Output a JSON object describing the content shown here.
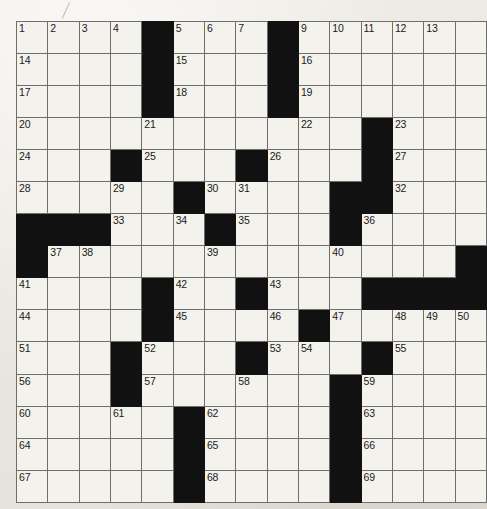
{
  "puzzle": {
    "type": "crossword-grid",
    "title": "",
    "rows": 15,
    "cols": 15,
    "cell_size_px": 30,
    "colors": {
      "paper": "#eceae4",
      "cell_fill": "#f4f2ec",
      "block_fill": "#111111",
      "grid_line": "#6e6e6e",
      "border": "#4a4a4a",
      "number_text": "#1a1a1a"
    },
    "marks": {
      "pencil_stroke": "stray-pencil-mark"
    },
    "black_cells": [
      [
        1,
        5
      ],
      [
        1,
        9
      ],
      [
        2,
        5
      ],
      [
        2,
        9
      ],
      [
        3,
        5
      ],
      [
        3,
        9
      ],
      [
        4,
        12
      ],
      [
        5,
        4
      ],
      [
        5,
        8
      ],
      [
        5,
        12
      ],
      [
        6,
        6
      ],
      [
        6,
        11
      ],
      [
        6,
        12
      ],
      [
        7,
        1
      ],
      [
        7,
        2
      ],
      [
        7,
        3
      ],
      [
        7,
        7
      ],
      [
        7,
        11
      ],
      [
        8,
        1
      ],
      [
        8,
        15
      ],
      [
        9,
        5
      ],
      [
        9,
        8
      ],
      [
        9,
        12
      ],
      [
        9,
        13
      ],
      [
        9,
        14
      ],
      [
        9,
        15
      ],
      [
        10,
        5
      ],
      [
        10,
        10
      ],
      [
        11,
        4
      ],
      [
        11,
        8
      ],
      [
        11,
        12
      ],
      [
        12,
        4
      ],
      [
        12,
        11
      ],
      [
        13,
        6
      ],
      [
        13,
        11
      ],
      [
        14,
        6
      ],
      [
        14,
        11
      ],
      [
        15,
        6
      ],
      [
        15,
        11
      ]
    ],
    "numbered_cells": [
      {
        "n": 1,
        "row": 1,
        "col": 1
      },
      {
        "n": 2,
        "row": 1,
        "col": 2
      },
      {
        "n": 3,
        "row": 1,
        "col": 3
      },
      {
        "n": 4,
        "row": 1,
        "col": 4
      },
      {
        "n": 5,
        "row": 1,
        "col": 6
      },
      {
        "n": 6,
        "row": 1,
        "col": 7
      },
      {
        "n": 7,
        "row": 1,
        "col": 8
      },
      {
        "n": 8,
        "row": 1,
        "col": 9
      },
      {
        "n": 9,
        "row": 1,
        "col": 10
      },
      {
        "n": 10,
        "row": 1,
        "col": 11
      },
      {
        "n": 11,
        "row": 1,
        "col": 12
      },
      {
        "n": 12,
        "row": 1,
        "col": 13
      },
      {
        "n": 13,
        "row": 1,
        "col": 14
      },
      {
        "n": 14,
        "row": 2,
        "col": 1
      },
      {
        "n": 15,
        "row": 2,
        "col": 6
      },
      {
        "n": 16,
        "row": 2,
        "col": 10
      },
      {
        "n": 17,
        "row": 3,
        "col": 1
      },
      {
        "n": 18,
        "row": 3,
        "col": 6
      },
      {
        "n": 19,
        "row": 3,
        "col": 10
      },
      {
        "n": 20,
        "row": 4,
        "col": 1
      },
      {
        "n": 21,
        "row": 4,
        "col": 5
      },
      {
        "n": 22,
        "row": 4,
        "col": 10
      },
      {
        "n": 23,
        "row": 4,
        "col": 13
      },
      {
        "n": 24,
        "row": 5,
        "col": 1
      },
      {
        "n": 25,
        "row": 5,
        "col": 5
      },
      {
        "n": 26,
        "row": 5,
        "col": 9
      },
      {
        "n": 27,
        "row": 5,
        "col": 13
      },
      {
        "n": 28,
        "row": 6,
        "col": 1
      },
      {
        "n": 29,
        "row": 6,
        "col": 4
      },
      {
        "n": 30,
        "row": 6,
        "col": 7
      },
      {
        "n": 31,
        "row": 6,
        "col": 8
      },
      {
        "n": 32,
        "row": 6,
        "col": 13
      },
      {
        "n": 33,
        "row": 7,
        "col": 4
      },
      {
        "n": 34,
        "row": 7,
        "col": 6
      },
      {
        "n": 35,
        "row": 7,
        "col": 8
      },
      {
        "n": 36,
        "row": 7,
        "col": 12
      },
      {
        "n": 37,
        "row": 8,
        "col": 2
      },
      {
        "n": 38,
        "row": 8,
        "col": 3
      },
      {
        "n": 39,
        "row": 8,
        "col": 7
      },
      {
        "n": 40,
        "row": 8,
        "col": 11
      },
      {
        "n": 41,
        "row": 9,
        "col": 1
      },
      {
        "n": 42,
        "row": 9,
        "col": 6
      },
      {
        "n": 43,
        "row": 9,
        "col": 9
      },
      {
        "n": 44,
        "row": 10,
        "col": 1
      },
      {
        "n": 45,
        "row": 10,
        "col": 6
      },
      {
        "n": 46,
        "row": 10,
        "col": 9
      },
      {
        "n": 47,
        "row": 10,
        "col": 11
      },
      {
        "n": 48,
        "row": 10,
        "col": 13
      },
      {
        "n": 49,
        "row": 10,
        "col": 14
      },
      {
        "n": 50,
        "row": 10,
        "col": 15
      },
      {
        "n": 51,
        "row": 11,
        "col": 1
      },
      {
        "n": 52,
        "row": 11,
        "col": 5
      },
      {
        "n": 53,
        "row": 11,
        "col": 9
      },
      {
        "n": 54,
        "row": 11,
        "col": 10
      },
      {
        "n": 55,
        "row": 11,
        "col": 13
      },
      {
        "n": 56,
        "row": 12,
        "col": 1
      },
      {
        "n": 57,
        "row": 12,
        "col": 5
      },
      {
        "n": 58,
        "row": 12,
        "col": 8
      },
      {
        "n": 59,
        "row": 12,
        "col": 12
      },
      {
        "n": 60,
        "row": 13,
        "col": 1
      },
      {
        "n": 61,
        "row": 13,
        "col": 4
      },
      {
        "n": 62,
        "row": 13,
        "col": 7
      },
      {
        "n": 63,
        "row": 13,
        "col": 12
      },
      {
        "n": 64,
        "row": 14,
        "col": 1
      },
      {
        "n": 65,
        "row": 14,
        "col": 7
      },
      {
        "n": 66,
        "row": 14,
        "col": 12
      },
      {
        "n": 67,
        "row": 15,
        "col": 1
      },
      {
        "n": 68,
        "row": 15,
        "col": 7
      },
      {
        "n": 69,
        "row": 15,
        "col": 12
      }
    ],
    "entries": []
  }
}
